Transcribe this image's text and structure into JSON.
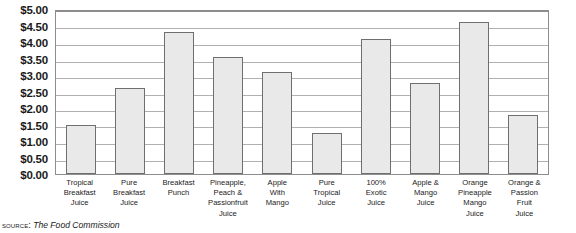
{
  "chart_data": {
    "type": "bar",
    "title": "",
    "xlabel": "",
    "ylabel": "",
    "ylim": [
      0,
      5
    ],
    "ytick_step": 0.5,
    "grid": true,
    "legend": "none",
    "currency_prefix": "$",
    "categories": [
      "Tropical Breakfast Juice",
      "Pure Breakfast Juice",
      "Breakfast Punch",
      "Pineapple, Peach & Passionfruit Juice",
      "Apple With Mango",
      "Pure Tropical Juice",
      "100% Exotic Juice",
      "Apple & Mango Juice",
      "Orange Pineapple Mango Juice",
      "Orange & Passion Fruit Juice"
    ],
    "category_lines": [
      [
        "Tropical",
        "Breakfast",
        "Juice"
      ],
      [
        "Pure",
        "Breakfast",
        "Juice"
      ],
      [
        "Breakfast",
        "Punch"
      ],
      [
        "Pineapple,",
        "Peach &",
        "Passionfruit",
        "Juice"
      ],
      [
        "Apple",
        "With",
        "Mango"
      ],
      [
        "Pure",
        "Tropical",
        "Juice"
      ],
      [
        "100%",
        "Exotic",
        "Juice"
      ],
      [
        "Apple &",
        "Mango",
        "Juice"
      ],
      [
        "Orange",
        "Pineapple",
        "Mango",
        "Juice"
      ],
      [
        "Orange &",
        "Passion",
        "Fruit",
        "Juice"
      ]
    ],
    "values": [
      1.5,
      2.62,
      4.3,
      3.55,
      3.1,
      1.25,
      4.1,
      2.75,
      4.62,
      1.8
    ],
    "ytick_labels": [
      "$5.00",
      "$4.50",
      "$4.00",
      "$3.50",
      "$3.00",
      "$2.50",
      "$2.00",
      "$1.50",
      "$1.00",
      "$0.50",
      "$0.00"
    ],
    "ytick_values": [
      5.0,
      4.5,
      4.0,
      3.5,
      3.0,
      2.5,
      2.0,
      1.5,
      1.0,
      0.5,
      0.0
    ],
    "bar_fill_color": "#e9e9e9",
    "bar_border_color": "#6f6f6f",
    "gridline_color": "#b0b0b0",
    "axis_color": "#8d8d8d"
  },
  "source": {
    "label": "Source:",
    "text": "The Food Commission"
  }
}
